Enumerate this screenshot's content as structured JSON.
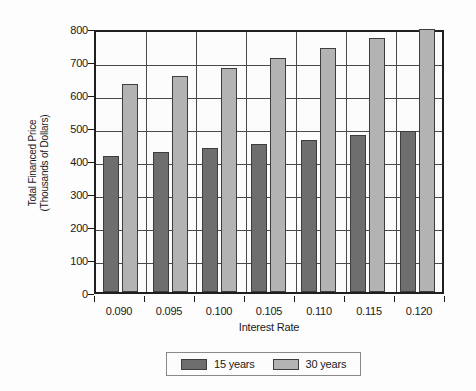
{
  "chart_data": {
    "type": "bar",
    "title": "",
    "xlabel": "Interest Rate",
    "ylabel": "Total Financed Price (Thousands of Dollars)",
    "ylabel_lines": [
      "Total Financed Price",
      "(Thousands of Dollars)"
    ],
    "categories": [
      "0.090",
      "0.095",
      "0.100",
      "0.105",
      "0.110",
      "0.115",
      "0.120"
    ],
    "series": [
      {
        "name": "15 years",
        "color": "#6e6e6e",
        "values": [
          412,
          425,
          437,
          450,
          462,
          475,
          488
        ]
      },
      {
        "name": "30 years",
        "color": "#b3b3b3",
        "values": [
          629,
          654,
          680,
          710,
          740,
          770,
          798
        ]
      }
    ],
    "ylim": [
      0,
      800
    ],
    "ytick_values": [
      0,
      100,
      200,
      300,
      400,
      500,
      600,
      700,
      800
    ],
    "ytick_labels": [
      "0",
      "100",
      "200",
      "300",
      "400",
      "500",
      "600",
      "700",
      "800"
    ],
    "grid": true,
    "legend_position": "bottom-center"
  },
  "legend": {
    "entries": [
      {
        "label": "15 years",
        "color": "#6e6e6e"
      },
      {
        "label": "30 years",
        "color": "#b3b3b3"
      }
    ]
  },
  "colors": {
    "series_15_years": "#6e6e6e",
    "series_30_years": "#b3b3b3",
    "axis": "#1f1f1f",
    "grid": "#4a4a4a",
    "background": "#fdfdfd"
  }
}
